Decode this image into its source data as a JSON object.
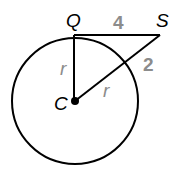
{
  "diagram": {
    "points": {
      "Q": "Q",
      "S": "S",
      "C": "C"
    },
    "labels": {
      "QS": "4",
      "outside_segment": "2",
      "radius_QC": "r",
      "radius_CS": "r"
    },
    "colors": {
      "stroke": "#000000",
      "number_label": "#8c8c8c"
    }
  }
}
